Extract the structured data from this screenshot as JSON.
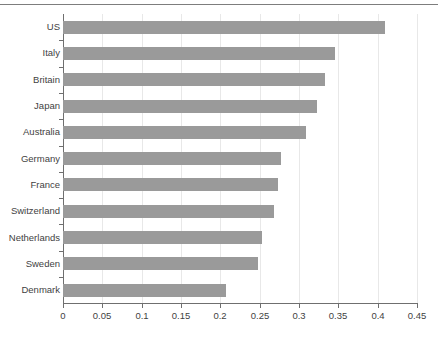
{
  "chart_data": {
    "type": "bar",
    "orientation": "horizontal",
    "title": "",
    "subtitle": "",
    "xlabel": "",
    "ylabel": "",
    "categories": [
      "US",
      "Italy",
      "Britain",
      "Japan",
      "Australia",
      "Germany",
      "France",
      "Switzerland",
      "Netherlands",
      "Sweden",
      "Denmark"
    ],
    "values": [
      0.409,
      0.346,
      0.333,
      0.323,
      0.309,
      0.277,
      0.273,
      0.268,
      0.253,
      0.248,
      0.207
    ],
    "xlim": [
      0,
      0.45
    ],
    "xticks": [
      0,
      0.05,
      0.1,
      0.15,
      0.2,
      0.25,
      0.3,
      0.35,
      0.4,
      0.45
    ],
    "xticklabels": [
      "0",
      "0.05",
      "0.1",
      "0.15",
      "0.2",
      "0.25",
      "0.3",
      "0.35",
      "0.4",
      "0.45"
    ],
    "grid": "vertical",
    "legend": null,
    "bar_color": "#9a9a9a",
    "axis_color": "#6f6f6f",
    "gridline_color": "#e8e8e8",
    "text_color": "#3f3f3f"
  }
}
